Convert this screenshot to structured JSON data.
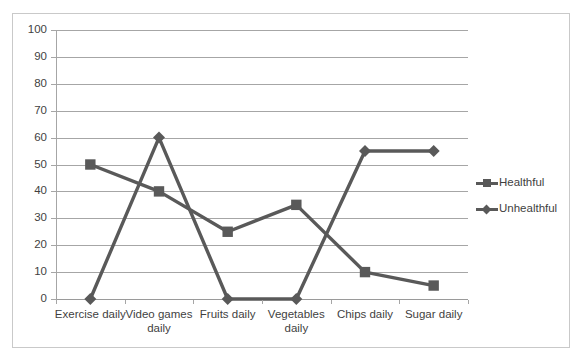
{
  "chart_data": {
    "type": "line",
    "title": "",
    "xlabel": "",
    "ylabel": "",
    "categories": [
      "Exercise daily",
      "Video games daily",
      "Fruits daily",
      "Vegetables daily",
      "Chips daily",
      "Sugar daily"
    ],
    "series": [
      {
        "name": "Healthful",
        "marker": "square",
        "color": "#595959",
        "values": [
          50,
          40,
          25,
          35,
          10,
          5
        ]
      },
      {
        "name": "Unhealthful",
        "marker": "diamond",
        "color": "#595959",
        "values": [
          0,
          60,
          0,
          0,
          55,
          55
        ]
      }
    ],
    "ylim": [
      0,
      100
    ],
    "ytick_step": 10,
    "yticks": [
      0,
      10,
      20,
      30,
      40,
      50,
      60,
      70,
      80,
      90,
      100
    ],
    "ytick_labels": [
      "0",
      "10",
      "20",
      "30",
      "40",
      "50",
      "60",
      "70",
      "80",
      "90",
      "100"
    ],
    "grid": true,
    "grid_axis": "y",
    "grid_color": "#a6a6a6",
    "legend_position": "right",
    "plot_background": "#ffffff",
    "border_color": "#c9c9c9"
  },
  "legend": {
    "entries": [
      {
        "label": "Healthful",
        "marker": "square-marker-icon"
      },
      {
        "label": "Unhealthful",
        "marker": "diamond-marker-icon"
      }
    ]
  }
}
